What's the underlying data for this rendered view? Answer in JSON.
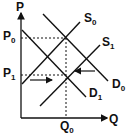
{
  "diagram": {
    "type": "supply-demand",
    "axes": {
      "y_label": "P",
      "x_label": "Q"
    },
    "price_levels": [
      {
        "label": "P",
        "subscript": "0"
      },
      {
        "label": "P",
        "subscript": "1"
      }
    ],
    "quantity_levels": [
      {
        "label": "Q",
        "subscript": "0"
      }
    ],
    "curves": [
      {
        "name": "S",
        "subscript": "0",
        "kind": "supply"
      },
      {
        "name": "S",
        "subscript": "1",
        "kind": "supply"
      },
      {
        "name": "D",
        "subscript": "0",
        "kind": "demand"
      },
      {
        "name": "D",
        "subscript": "1",
        "kind": "demand"
      }
    ],
    "arrows": [
      {
        "direction": "right",
        "meaning": "shift toward equilibrium from left"
      },
      {
        "direction": "left",
        "meaning": "shift toward equilibrium from right"
      }
    ],
    "colors": {
      "line": "#111111",
      "background": "#ffffff"
    }
  }
}
